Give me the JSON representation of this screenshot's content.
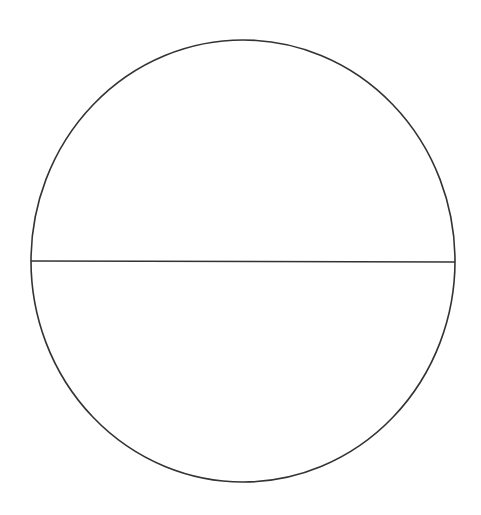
{
  "diagram": {
    "type": "circle-with-diameter",
    "background": "#ffffff",
    "stroke_color": "#333333",
    "stroke_width": 1.6,
    "circle": {
      "cx": 243,
      "cy": 261,
      "rx": 212,
      "ry": 221
    },
    "diameter": {
      "x1": 31,
      "y1": 261,
      "x2": 455,
      "y2": 262
    }
  }
}
